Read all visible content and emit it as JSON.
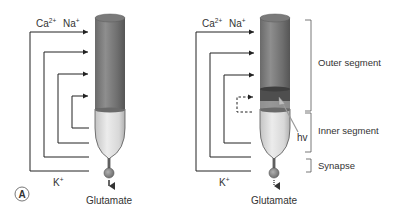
{
  "figure": {
    "panel_label": "A",
    "colors": {
      "outer_segment_dark": "#5f5f5f",
      "outer_segment_light": "#8c8c8c",
      "inner_segment_light": "#e8e8e8",
      "inner_segment_dark": "#b8b8b8",
      "line": "#222222",
      "text": "#333333"
    },
    "left_cell": {
      "state": "dark",
      "ions_in": {
        "ca": "Ca",
        "ca_sup": "2+",
        "na": "Na",
        "na_sup": "+"
      },
      "ions_out": {
        "k": "K",
        "k_sup": "+"
      },
      "output_label": "Glutamate",
      "circulating_loops": 4
    },
    "right_cell": {
      "state": "light",
      "ions_in": {
        "ca": "Ca",
        "ca_sup": "2+",
        "na": "Na",
        "na_sup": "+"
      },
      "ions_out": {
        "k": "K",
        "k_sup": "+"
      },
      "output_label": "Glutamate",
      "stimulus_label": "hv",
      "circulating_loops": 4,
      "dashed_loop_index": 3
    },
    "segments": [
      {
        "label": "Outer segment"
      },
      {
        "label": "Inner segment"
      },
      {
        "label": "Synapse"
      }
    ]
  }
}
